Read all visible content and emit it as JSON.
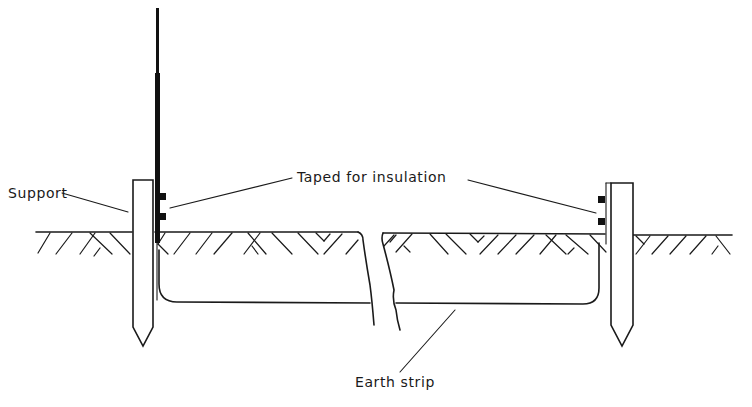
{
  "figure": {
    "type": "technical-line-drawing"
  },
  "labels": {
    "support": "Support",
    "taped": "Taped for insulation",
    "earth_strip": "Earth strip"
  },
  "colors": {
    "ink": "#1a1a1a",
    "background": "#ffffff"
  }
}
